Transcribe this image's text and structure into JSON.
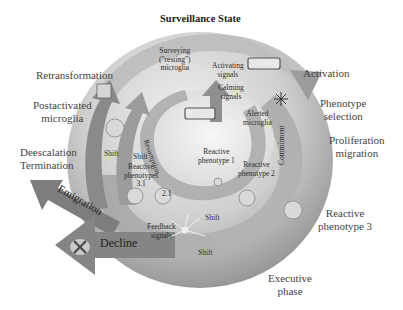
{
  "title": "Surveillance State",
  "outer_labels": {
    "retransformation": "Retransformation",
    "postactivated_1": "Postactivated",
    "postactivated_2": "microglia",
    "deescalation": "Deescalation",
    "termination": "Termination",
    "activation": "Activation",
    "phenotype_1": "Phenotype",
    "phenotype_2": "selection",
    "proliferation_1": "Proliferation",
    "proliferation_2": "migration",
    "reactive3_1": "Reactive",
    "reactive3_2": "phenotype 3",
    "executive_1": "Executive",
    "executive_2": "phase"
  },
  "inner_labels": {
    "surveying_1": "Surveying",
    "surveying_2": "(\"resting\")",
    "surveying_3": "microglia",
    "activating_1": "Activating",
    "activating_2": "signals",
    "calming_1": "Calming",
    "calming_2": "signals",
    "alerted_1": "Alerted",
    "alerted_2": "microglia",
    "reactive1_1": "Reactive",
    "reactive1_2": "phenotype 1",
    "reactive2_1": "Reactive",
    "reactive2_2": "phenotype 2",
    "reactive31_1": "Reactive",
    "reactive31_2": "phenotypes",
    "reactive31_3": "3.1",
    "reactive21": "2.1",
    "shift_a": "Shift",
    "shift_b": "Shift",
    "shift_c": "Shift",
    "shift_d": "Shift",
    "feedback_1": "Feedback",
    "feedback_2": "signals",
    "resumption": "Resumption",
    "commitment": "Commitment"
  },
  "arrow_labels": {
    "emigration": "Emigration",
    "decline": "Decline"
  },
  "colors": {
    "disc_light": "#e6e6e6",
    "disc_dark": "#8c8c8c",
    "arrow_dark": "#7a7a7a",
    "arrow_mid": "#a8a8a8",
    "text": "#3a3a3a"
  }
}
